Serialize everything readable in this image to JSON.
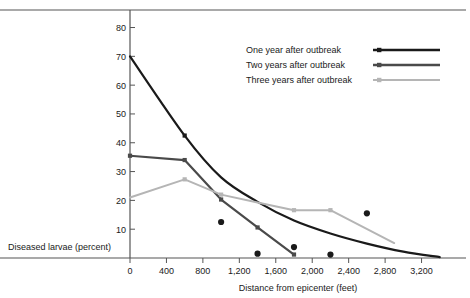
{
  "chart_data": {
    "type": "line",
    "title": "",
    "xlabel": "Distance from epicenter (feet)",
    "ylabel": "Diseased larvae (percent)",
    "xlim": [
      0,
      3600
    ],
    "ylim": [
      0,
      84
    ],
    "grid": false,
    "legend_position": "top-right",
    "xticks": [
      0,
      400,
      800,
      1200,
      1600,
      2000,
      2400,
      2800,
      3200
    ],
    "xticklabels": [
      "0",
      "400",
      "800",
      "1,200",
      "1,600",
      "2,000",
      "2,400",
      "2,800",
      "3,200"
    ],
    "yticks": [
      10,
      20,
      30,
      40,
      50,
      60,
      70,
      80
    ],
    "yticklabels": [
      "10",
      "20",
      "30",
      "40",
      "50",
      "60",
      "70",
      "80"
    ],
    "series": [
      {
        "name": "One year after outbreak",
        "color": "#1a1a1a",
        "style": "smooth-curve",
        "x": [
          0,
          600,
          1000,
          1400,
          1800,
          2200,
          2600,
          3000,
          3400
        ],
        "values": [
          70,
          42.5,
          28,
          19.5,
          13,
          8.5,
          5,
          2.2,
          0.3
        ],
        "markers_x": [
          600
        ],
        "markers_y": [
          42.5
        ]
      },
      {
        "name": "Two years after outbreak",
        "color": "#4a4a4a",
        "style": "polyline",
        "x": [
          0,
          600,
          1000,
          1400,
          1800
        ],
        "values": [
          35.5,
          34,
          20.3,
          10.6,
          1.2
        ],
        "markers_x": [
          0,
          600,
          1000,
          1400,
          1800
        ],
        "markers_y": [
          35.5,
          34,
          20.3,
          10.6,
          1.2
        ]
      },
      {
        "name": "Three years after outbreak",
        "color": "#b5b5b5",
        "style": "polyline",
        "x": [
          0,
          600,
          1000,
          1400,
          1800,
          2200,
          2900
        ],
        "values": [
          21,
          27.3,
          22,
          19.3,
          16.6,
          16.6,
          5.2
        ],
        "markers_x": [
          600,
          1000,
          1800,
          2200
        ],
        "markers_y": [
          27.3,
          22,
          16.6,
          16.6
        ]
      }
    ],
    "scatter": {
      "name": "observed points",
      "color": "#1a1a1a",
      "x": [
        1000,
        1400,
        1800,
        2200,
        2600
      ],
      "values": [
        12.5,
        1.5,
        3.8,
        1.2,
        15.5
      ]
    }
  },
  "legend": {
    "entries": [
      {
        "label": "One year after outbreak",
        "color": "#1a1a1a"
      },
      {
        "label": "Two years after outbreak",
        "color": "#4a4a4a"
      },
      {
        "label": "Three years after outbreak",
        "color": "#b5b5b5"
      }
    ]
  },
  "colors": {
    "one_year": "#1a1a1a",
    "two_years": "#4a4a4a",
    "three_years": "#b5b5b5",
    "axis": "#555555",
    "text": "#1a1a1a"
  }
}
